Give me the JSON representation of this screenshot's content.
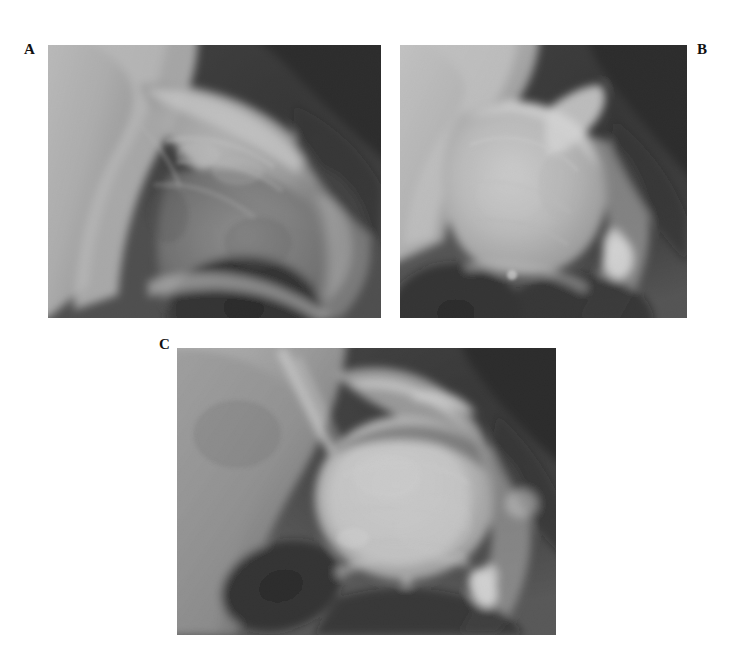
{
  "figure": {
    "kind": "radiograph-figure",
    "background_color": "#ffffff",
    "width": 737,
    "height": 649,
    "modality": "plain-radiograph",
    "anatomy": "hip"
  },
  "panels": [
    {
      "id": "a",
      "label": "A",
      "label_position": "top-left-outside",
      "description": "Anteroposterior radiograph of the hip showing the acetabulum, femoral head and proximal femur",
      "x": 48,
      "y": 45,
      "width": 333,
      "height": 273,
      "tone": {
        "background": "#0d0d0d",
        "soft_tissue": "#6a6a6a",
        "bone": "#cdcdcd",
        "dense_bone": "#f2f2f2"
      },
      "features": [
        "iliac wing bright at upper left",
        "acetabular roof with irregular sclerosis",
        "joint space narrowing centrally",
        "obturator foramen as dark lucency at lower centre",
        "greater trochanter region mottled at right",
        "dark soft tissue field at upper right"
      ]
    },
    {
      "id": "b",
      "label": "B",
      "label_position": "top-right-outside",
      "description": "Anteroposterior radiograph of the hip with dense sclerotic femoral head and a bright focal calcification laterally",
      "x": 400,
      "y": 45,
      "width": 287,
      "height": 273,
      "tone": {
        "background": "#0a0a0a",
        "soft_tissue": "#707070",
        "bone": "#d8d8d8",
        "dense_bone": "#fbfbfb"
      },
      "features": [
        "markedly dense flattened femoral head",
        "bright cortical rim over the femoral neck",
        "focal bright calcific nodule lateral to the femoral head",
        "deep dark region at upper right",
        "dark obturator foramen at lower left"
      ]
    },
    {
      "id": "c",
      "label": "C",
      "label_position": "top-left-outside",
      "description": "Anteroposterior radiograph of the hip showing a rounded sclerotic femoral head, preserved acetabulum and an inferolateral calcific density",
      "x": 177,
      "y": 348,
      "width": 379,
      "height": 287,
      "tone": {
        "background": "#101010",
        "soft_tissue": "#767676",
        "bone": "#dcdcdc",
        "dense_bone": "#fcfcfc"
      },
      "features": [
        "rounded dense femoral head centrally",
        "sharp bright iliopectineal line sweeping inferolaterally",
        "dark obturator foramen at lower left",
        "bright calcific density at lower right",
        "dark soft tissue field at upper right corner"
      ]
    }
  ]
}
